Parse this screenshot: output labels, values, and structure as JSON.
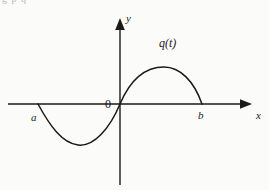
{
  "figure": {
    "background_color": "#fbfbfa",
    "stroke_color": "#1a1a1a",
    "width": 269,
    "height": 190,
    "top_cut_text": "g p q"
  },
  "axes": {
    "x_axis_label": "x",
    "y_axis_label": "y",
    "origin_label": "0",
    "x_axis_y_px": 104,
    "y_axis_x_px": 120,
    "x_axis_start_px": 8,
    "x_axis_end_px": 252,
    "y_axis_top_px": 18,
    "y_axis_bottom_px": 185
  },
  "curve": {
    "function_label": "q(t)",
    "left_root_label": "a",
    "right_root_label": "b"
  },
  "chart_data": {
    "type": "line",
    "title": "",
    "xlabel": "x",
    "ylabel": "y",
    "grid": false,
    "legend": "none",
    "annotations": [
      "q(t)",
      "a",
      "b",
      "0"
    ],
    "series": [
      {
        "name": "q(t)",
        "points_px": [
          [
            38,
            104
          ],
          [
            44,
            113
          ],
          [
            50,
            121
          ],
          [
            56,
            129
          ],
          [
            62,
            135
          ],
          [
            68,
            140
          ],
          [
            74,
            143
          ],
          [
            78,
            145
          ],
          [
            84,
            145
          ],
          [
            90,
            143
          ],
          [
            96,
            139
          ],
          [
            102,
            133
          ],
          [
            108,
            126
          ],
          [
            114,
            115
          ],
          [
            120,
            104
          ],
          [
            126,
            95
          ],
          [
            132,
            87
          ],
          [
            138,
            81
          ],
          [
            144,
            75
          ],
          [
            150,
            71
          ],
          [
            157,
            68
          ],
          [
            164,
            67
          ],
          [
            171,
            68
          ],
          [
            178,
            71
          ],
          [
            184,
            76
          ],
          [
            190,
            83
          ],
          [
            196,
            92
          ],
          [
            202,
            104
          ]
        ],
        "roots_px": [
          38,
          120,
          202
        ],
        "minimum_px": [
          78,
          145
        ],
        "maximum_px": [
          164,
          67
        ]
      }
    ],
    "xlim_px": [
      8,
      252
    ],
    "ylim_px": [
      18,
      185
    ]
  }
}
